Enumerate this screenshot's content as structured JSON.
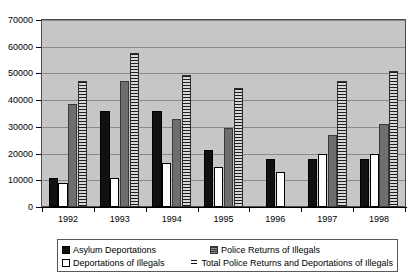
{
  "chart_data": {
    "type": "bar",
    "title": "",
    "subtitle": "",
    "xlabel": "",
    "ylabel": "",
    "categories": [
      "1992",
      "1993",
      "1994",
      "1995",
      "1996",
      "1997",
      "1998"
    ],
    "ylim": [
      0,
      70000
    ],
    "ytick_step": 10000,
    "yticks": [
      "70000",
      "60000",
      "50000",
      "40000",
      "30000",
      "20000",
      "10000",
      "0"
    ],
    "ytick_values": [
      70000,
      60000,
      50000,
      40000,
      30000,
      20000,
      10000,
      0
    ],
    "grid": true,
    "grid_axis": "y",
    "legend_position": "bottom",
    "plot_background": "#c6c6c6",
    "series": [
      {
        "name": "Asylum Deportations",
        "style": "solid-black",
        "color": "#111111",
        "values": [
          11000,
          36000,
          36000,
          21500,
          18000,
          18000,
          18000
        ]
      },
      {
        "name": "Deportations of Illegals",
        "style": "solid-white",
        "color": "#ffffff",
        "values": [
          9000,
          10800,
          16500,
          15000,
          13000,
          20000,
          20000
        ]
      },
      {
        "name": "Police Returns of Illegals",
        "style": "solid-gray",
        "color": "#6e6e6e",
        "values": [
          38500,
          47000,
          33000,
          29500,
          null,
          27000,
          31000
        ]
      },
      {
        "name": "Total Police Returns and Deportations of Illegals",
        "style": "horizontal-hatch",
        "color": "#cfcfcf",
        "values": [
          47000,
          57500,
          49500,
          44500,
          null,
          47000,
          51000
        ]
      }
    ]
  },
  "legend": {
    "items": [
      {
        "label": "Asylum Deportations",
        "swatch": "solid-black-swatch"
      },
      {
        "label": "Police Returns of Illegals",
        "swatch": "solid-gray-swatch"
      },
      {
        "label": "Deportations of Illegals",
        "swatch": "solid-white-swatch"
      },
      {
        "label": "Total Police Returns and Deportations of Illegals",
        "swatch": "hatch-swatch"
      }
    ]
  }
}
